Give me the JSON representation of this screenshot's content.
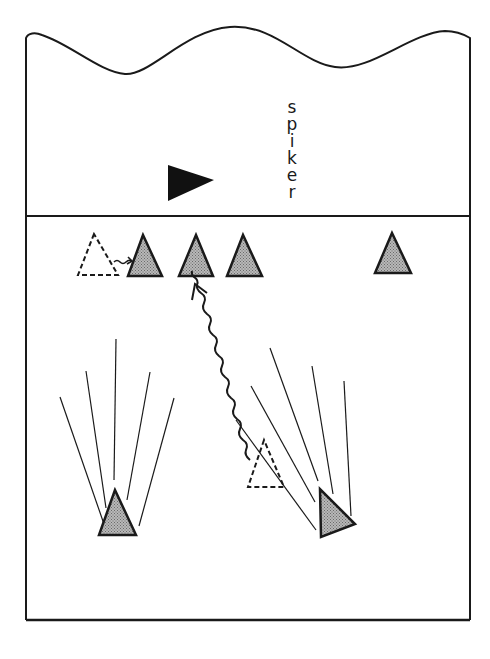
{
  "diagram": {
    "title": "",
    "labels": {
      "spiker": "spiker"
    },
    "colors": {
      "ink": "#1a1a1a",
      "player_fill": "#9a9a9a",
      "background": "#ffffff"
    },
    "elements": {
      "court_boundary": "court outline with wavy far edge",
      "net": "net line",
      "spiker": "spiker (solid black triangle, facing right)",
      "front_row_players": [
        "front-row player 1",
        "front-row player 2",
        "front-row player 3",
        "front-row player 4"
      ],
      "ghost_positions": [
        "original position (dashed) front row",
        "original position (dashed) back court"
      ],
      "back_row_players": [
        "back-row player left",
        "back-row player right"
      ],
      "movement_arrows": [
        "short wavy arrow: dashed position to front-row player 1",
        "long wavy arrow: back-court dashed position to front-row player 2"
      ],
      "sight_lines": {
        "left_player_count": 5,
        "right_player_count": 5
      }
    }
  }
}
